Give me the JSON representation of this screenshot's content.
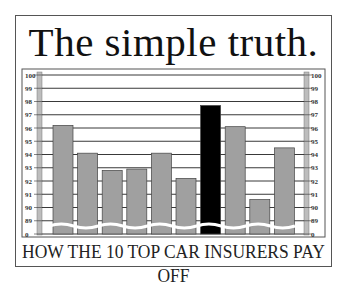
{
  "title": "The simple truth.",
  "footer": "HOW THE 10 TOP CAR INSURERS PAY OFF",
  "chart_data": {
    "type": "bar",
    "title": "The simple truth.",
    "subtitle": "HOW THE 10 TOP CAR INSURERS PAY OFF",
    "xlabel": "",
    "ylabel": "",
    "categories": [
      "1",
      "2",
      "3",
      "4",
      "5",
      "6",
      "7",
      "8",
      "9",
      "10"
    ],
    "values": [
      96.2,
      94.1,
      92.8,
      92.9,
      94.1,
      92.2,
      97.7,
      96.1,
      90.6,
      94.5
    ],
    "highlight_index": 6,
    "ylim": [
      88,
      100
    ],
    "axis_break": true,
    "yticks": [
      "0",
      "89",
      "90",
      "91",
      "92",
      "93",
      "94",
      "95",
      "96",
      "97",
      "98",
      "99",
      "100"
    ],
    "ytick_values": [
      88,
      89,
      90,
      91,
      92,
      93,
      94,
      95,
      96,
      97,
      98,
      99,
      100
    ],
    "grid": true,
    "legend": "none",
    "colors": {
      "bar": "#a0a0a0",
      "highlight": "#000000",
      "grid": "#222222",
      "axis_strip": "#bdbdbd"
    }
  }
}
